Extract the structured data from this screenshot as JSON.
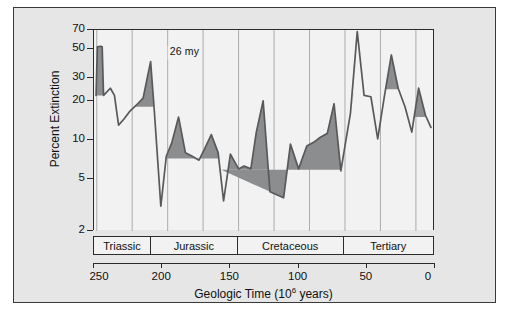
{
  "figure": {
    "background": "#e6e6e6",
    "plot_background": "#f2f2f2",
    "line_color": "#58595b",
    "fill_color": "#8c8d8f",
    "axis_color": "#2b2b2b"
  },
  "chart_data": {
    "type": "line",
    "title": "",
    "xlabel": "Geologic Time (10⁶ years)",
    "ylabel": "Percent Extinction",
    "xlim": [
      250,
      0
    ],
    "ylim": [
      2,
      70
    ],
    "yscale": "log",
    "xscale": "linear",
    "grid": "vertical-only",
    "legend": "none",
    "xticks": [
      250,
      200,
      150,
      100,
      50,
      0
    ],
    "xticklabels": [
      "250",
      "200",
      "150",
      "100",
      "50",
      "0"
    ],
    "yticks": [
      2,
      5,
      10,
      20,
      30,
      50,
      70
    ],
    "yticklabels": [
      "2",
      "5",
      "10",
      "20",
      "30",
      "50",
      "70"
    ],
    "gridlines_x": [
      248,
      222,
      196,
      170,
      144,
      118,
      92,
      66,
      40,
      14
    ],
    "periodicity_my": 26,
    "annotations": [
      {
        "name": "periodicity-span",
        "text": "26 my",
        "x_start": 196,
        "x_end": 170,
        "y": 45,
        "style": "double-headed-arrow"
      }
    ],
    "period_bands": [
      {
        "label": "Triassic",
        "start": 250,
        "end": 208
      },
      {
        "label": "Jurassic",
        "start": 208,
        "end": 144
      },
      {
        "label": "Cretaceous",
        "start": 144,
        "end": 66
      },
      {
        "label": "Tertiary",
        "start": 66,
        "end": 0
      }
    ],
    "series": [
      {
        "name": "Percent Extinction",
        "x": [
          248.5,
          247.5,
          245.0,
          244.0,
          243.0,
          238.0,
          235.0,
          232.0,
          228.0,
          224.0,
          219.0,
          214.0,
          208.5,
          206.0,
          201.0,
          197.0,
          193.0,
          188.0,
          183.0,
          178.0,
          173.0,
          169.0,
          164.0,
          159.0,
          155.0,
          150.0,
          144.0,
          140.0,
          135.0,
          131.0,
          126.0,
          121.0,
          116.0,
          111.0,
          106.0,
          100.0,
          94.0,
          89.0,
          84.0,
          79.0,
          74.0,
          69.0,
          66.0,
          62.0,
          57.0,
          52.0,
          47.0,
          42.0,
          37.0,
          32.0,
          27.0,
          22.0,
          17.0,
          12.0,
          7.0,
          3.0
        ],
        "y": [
          22.0,
          52.0,
          52.5,
          52.0,
          22.0,
          25.0,
          22.0,
          13.0,
          14.5,
          16.5,
          18.5,
          21.0,
          40.0,
          18.0,
          3.1,
          7.5,
          9.5,
          15.0,
          8.0,
          7.5,
          7.0,
          8.5,
          11.0,
          8.0,
          3.4,
          7.8,
          6.0,
          6.3,
          6.0,
          11.5,
          20.0,
          4.0,
          3.8,
          3.6,
          9.3,
          6.0,
          9.0,
          9.6,
          10.5,
          11.2,
          19.0,
          5.8,
          9.0,
          16.0,
          68.0,
          22.0,
          21.5,
          10.2,
          22.0,
          45.0,
          25.0,
          18.0,
          11.5,
          25.0,
          15.5,
          12.5
        ]
      }
    ],
    "shaded_peaks": [
      {
        "center_my": 248,
        "peak_percent": 52.5,
        "baseline_percent": 22.0
      },
      {
        "center_my": 220,
        "peak_percent": 40.0,
        "baseline_percent": 18.0
      },
      {
        "center_my": 194,
        "peak_percent": 15.0,
        "baseline_percent": 8.6
      },
      {
        "center_my": 173,
        "peak_percent": 11.0,
        "baseline_percent": 7.2
      },
      {
        "center_my": 144,
        "peak_percent": 7.8,
        "baseline_percent": 5.9
      },
      {
        "center_my": 131,
        "peak_percent": 20.0,
        "baseline_percent": 7.5
      },
      {
        "center_my": 113,
        "peak_percent": 9.3,
        "baseline_percent": 5.9
      },
      {
        "center_my": 91,
        "peak_percent": 19.0,
        "baseline_percent": 11.2
      },
      {
        "center_my": 65,
        "peak_percent": 68.0,
        "baseline_percent": 23.0
      },
      {
        "center_my": 38,
        "peak_percent": 45.0,
        "baseline_percent": 24.5
      },
      {
        "center_my": 11,
        "peak_percent": 25.0,
        "baseline_percent": 15.0
      }
    ]
  }
}
